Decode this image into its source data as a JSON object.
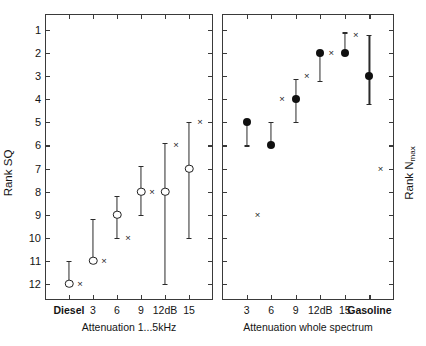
{
  "chart_data": {
    "type": "scatter",
    "title": "",
    "layout": "two side-by-side panels sharing an inverted rank axis",
    "grid": false,
    "legend": "none",
    "rank_axis": {
      "ticks": [
        1,
        2,
        3,
        4,
        5,
        6,
        7,
        8,
        9,
        10,
        11,
        12
      ],
      "tick_labels": [
        "1",
        "2",
        "3",
        "4",
        "5",
        "6",
        "7",
        "8",
        "9",
        "10",
        "11",
        "12"
      ],
      "ylim": [
        0.3,
        12.7
      ],
      "inverted": true,
      "note": "rank 1 at top"
    },
    "panels": [
      {
        "id": "left",
        "ylabel": "Rank SQ",
        "ylabel_side": "left",
        "ylabel_ticks_shown": true,
        "xlabel": "Attenuation 1...5kHz",
        "x_tick_labels": [
          "Diesel",
          "3",
          "6",
          "9",
          "12dB",
          "15"
        ],
        "x_tick_bold": [
          true,
          false,
          false,
          false,
          false,
          false
        ],
        "series": [
          {
            "name": "median rank (open circle) with range bars",
            "marker": "open-circle",
            "categories": [
              "Diesel",
              "3",
              "6",
              "9",
              "12dB",
              "15"
            ],
            "values": [
              12,
              11,
              9,
              8,
              8,
              7
            ],
            "err_low": [
              12,
              11,
              10,
              9,
              12,
              10
            ],
            "err_high": [
              11,
              9.2,
              8.2,
              6.9,
              5.9,
              5
            ]
          },
          {
            "name": "second measure (cross)",
            "marker": "cross",
            "categories": [
              "Diesel",
              "3",
              "6",
              "9",
              "12dB",
              "15"
            ],
            "values": [
              12,
              11,
              10,
              8,
              6,
              5
            ]
          }
        ]
      },
      {
        "id": "right",
        "ylabel": "Rank Nmax",
        "ylabel_side": "right",
        "ylabel_ticks_shown": false,
        "xlabel": "Attenuation whole spectrum",
        "x_tick_labels": [
          "3",
          "6",
          "9",
          "12dB",
          "15",
          "Gasoline"
        ],
        "x_tick_bold": [
          false,
          false,
          false,
          false,
          false,
          true
        ],
        "series": [
          {
            "name": "median rank (filled circle) with range bars",
            "marker": "filled-circle",
            "categories": [
              "3",
              "6",
              "9",
              "12dB",
              "15",
              "Gasoline"
            ],
            "values": [
              5,
              6,
              4,
              2,
              2,
              3
            ],
            "err_low": [
              6,
              6,
              5,
              3.2,
              2,
              4.2
            ],
            "err_high": [
              5,
              5,
              3.1,
              2,
              1.1,
              1.2
            ]
          },
          {
            "name": "second measure (cross)",
            "marker": "cross",
            "categories": [
              "3",
              "6",
              "9",
              "12dB",
              "15",
              "Gasoline"
            ],
            "values": [
              9,
              4,
              3,
              2,
              1.2,
              7
            ]
          }
        ]
      }
    ]
  }
}
